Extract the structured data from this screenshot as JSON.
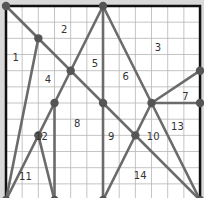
{
  "diagram": {
    "grid_size": 12,
    "origin_px": [
      6,
      6
    ],
    "unit_px": 16.17,
    "colors": {
      "background": "#ffffff",
      "outside": "#d9d9d9",
      "grid": "#b5b5b5",
      "border": "#111111",
      "line": "#6b6b6b",
      "node": "#555555",
      "label": "#333333"
    },
    "nodes": [
      [
        0,
        0
      ],
      [
        6,
        0
      ],
      [
        2,
        2
      ],
      [
        4,
        4
      ],
      [
        3,
        6
      ],
      [
        6,
        6
      ],
      [
        2,
        8
      ],
      [
        9,
        6
      ],
      [
        12,
        4
      ],
      [
        12,
        6
      ],
      [
        8,
        8
      ],
      [
        0,
        12
      ],
      [
        3,
        12
      ],
      [
        6,
        12
      ],
      [
        12,
        12
      ]
    ],
    "segments": [
      [
        [
          0,
          0
        ],
        [
          12,
          12
        ]
      ],
      [
        [
          2,
          2
        ],
        [
          0,
          12
        ]
      ],
      [
        [
          6,
          0
        ],
        [
          0,
          12
        ]
      ],
      [
        [
          6,
          0
        ],
        [
          6,
          12
        ]
      ],
      [
        [
          6,
          0
        ],
        [
          9,
          6
        ]
      ],
      [
        [
          9,
          6
        ],
        [
          12,
          4
        ]
      ],
      [
        [
          9,
          6
        ],
        [
          12,
          6
        ]
      ],
      [
        [
          9,
          6
        ],
        [
          6,
          12
        ]
      ],
      [
        [
          9,
          6
        ],
        [
          12,
          12
        ]
      ],
      [
        [
          3,
          6
        ],
        [
          3,
          12
        ]
      ],
      [
        [
          2,
          8
        ],
        [
          3,
          12
        ]
      ]
    ],
    "labels": [
      {
        "text": "1",
        "x": 0.6,
        "y": 3.2
      },
      {
        "text": "2",
        "x": 3.6,
        "y": 1.5
      },
      {
        "text": "3",
        "x": 9.4,
        "y": 2.6
      },
      {
        "text": "4",
        "x": 2.6,
        "y": 4.6
      },
      {
        "text": "5",
        "x": 5.5,
        "y": 3.6
      },
      {
        "text": "6",
        "x": 7.4,
        "y": 4.4
      },
      {
        "text": "7",
        "x": 11.1,
        "y": 5.6
      },
      {
        "text": "8",
        "x": 4.4,
        "y": 7.3
      },
      {
        "text": "9",
        "x": 6.5,
        "y": 8.1
      },
      {
        "text": "10",
        "x": 9.1,
        "y": 8.1
      },
      {
        "text": "11",
        "x": 1.2,
        "y": 10.6
      },
      {
        "text": "12",
        "x": 2.2,
        "y": 8.1
      },
      {
        "text": "13",
        "x": 10.6,
        "y": 7.5
      },
      {
        "text": "14",
        "x": 8.3,
        "y": 10.5
      }
    ]
  }
}
